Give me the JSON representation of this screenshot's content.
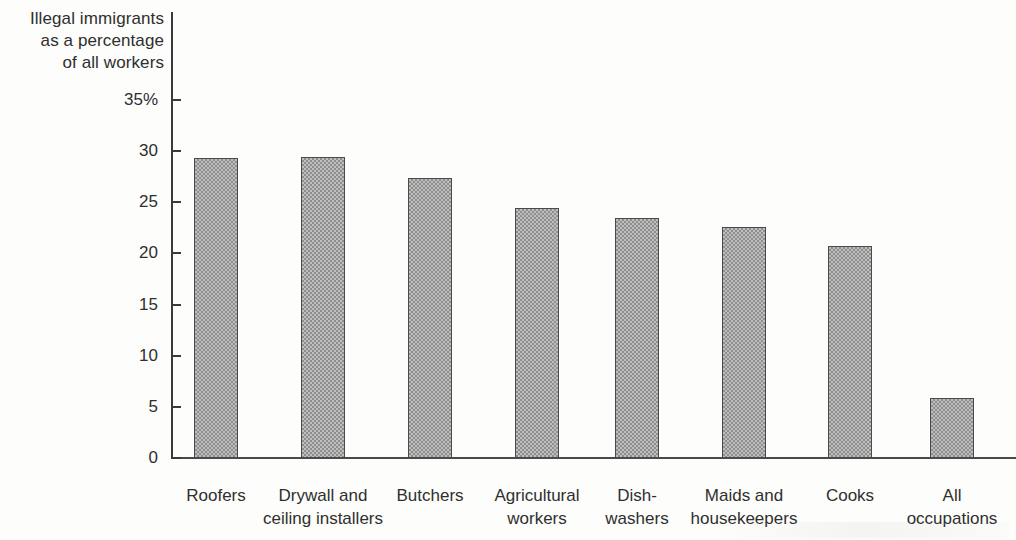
{
  "chart_data": {
    "type": "bar",
    "title": "",
    "subtitle": "",
    "ylabel": "Illegal immigrants\nas a percentage\nof all workers",
    "xlabel": "",
    "ylim": [
      0,
      35
    ],
    "ytick_labels": [
      "0",
      "5",
      "10",
      "15",
      "20",
      "25",
      "30",
      "35%"
    ],
    "ytick_values": [
      0,
      5,
      10,
      15,
      20,
      25,
      30,
      35
    ],
    "grid": false,
    "legend": "none",
    "categories": [
      "Roofers",
      "Drywall and\nceiling installers",
      "Butchers",
      "Agricultural\nworkers",
      "Dish-\nwashers",
      "Maids and\nhousekeepers",
      "Cooks",
      "All\noccupations"
    ],
    "values": [
      29.3,
      29.4,
      27.4,
      24.4,
      23.5,
      22.6,
      20.7,
      5.9
    ],
    "series": [
      {
        "name": "Illegal immigrants as a percentage of all workers",
        "values": [
          29.3,
          29.4,
          27.4,
          24.4,
          23.5,
          22.6,
          20.7,
          5.9
        ]
      }
    ],
    "bar_fill_color": "#bfbfbf",
    "bar_edge_color": "#4a4a4a",
    "axis_color": "#3a3a3a",
    "background_color": "#fdfdfb"
  },
  "axis": {
    "y_caption": "Illegal immigrants\nas a percentage\nof all workers",
    "ticks": [
      {
        "label": "35%",
        "value": 35
      },
      {
        "label": "30",
        "value": 30
      },
      {
        "label": "25",
        "value": 25
      },
      {
        "label": "20",
        "value": 20
      },
      {
        "label": "15",
        "value": 15
      },
      {
        "label": "10",
        "value": 10
      },
      {
        "label": "5",
        "value": 5
      },
      {
        "label": "0",
        "value": 0
      }
    ]
  },
  "bars": [
    {
      "label": "Roofers",
      "value": 29.3
    },
    {
      "label": "Drywall and\nceiling installers",
      "value": 29.4
    },
    {
      "label": "Butchers",
      "value": 27.4
    },
    {
      "label": "Agricultural\nworkers",
      "value": 24.4
    },
    {
      "label": "Dish-\nwashers",
      "value": 23.5
    },
    {
      "label": "Maids and\nhousekeepers",
      "value": 22.6
    },
    {
      "label": "Cooks",
      "value": 20.7
    },
    {
      "label": "All\noccupations",
      "value": 5.9
    }
  ]
}
